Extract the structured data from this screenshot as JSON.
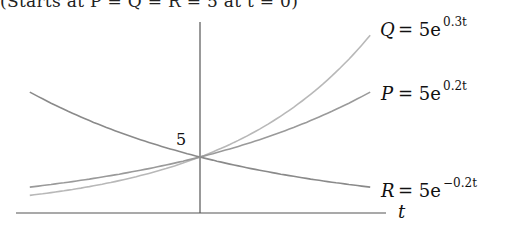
{
  "header": {
    "clipped_caption": "(Starts at P = Q = R = 5 at t = 0)"
  },
  "chart_data": {
    "type": "line",
    "title": "",
    "xlabel": "t",
    "ylabel": "",
    "annotations": [
      {
        "text": "5",
        "at": {
          "t": 0,
          "y": 5
        },
        "note": "common intercept of all curves"
      }
    ],
    "xlim": [
      -3.85,
      3.85
    ],
    "ylim": [
      0,
      18
    ],
    "grid": false,
    "legend": "inline labels at right end of each curve",
    "series": [
      {
        "name": "Q",
        "label": "Q = 5e^{0.3t}",
        "formula": "5*exp(0.3*t)",
        "color": "#b8b8b8",
        "x": [
          -3.85,
          -2,
          0,
          2,
          3.85
        ],
        "values": [
          1.58,
          2.74,
          5.0,
          9.11,
          15.9
        ]
      },
      {
        "name": "P",
        "label": "P = 5e^{0.2t}",
        "formula": "5*exp(0.2*t)",
        "color": "#9a9a9a",
        "x": [
          -3.85,
          -2,
          0,
          2,
          3.85
        ],
        "values": [
          2.32,
          3.35,
          5.0,
          7.46,
          10.8
        ]
      },
      {
        "name": "R",
        "label": "R = 5e^{-0.2t}",
        "formula": "5*exp(-0.2*t)",
        "color": "#8a8a8a",
        "x": [
          -3.85,
          -2,
          0,
          2,
          3.85
        ],
        "values": [
          10.8,
          7.46,
          5.0,
          3.35,
          2.32
        ]
      }
    ]
  },
  "labels": {
    "q_name": "Q",
    "q_rhs": "= 5e",
    "q_exp": "0.3t",
    "p_name": "P",
    "p_rhs": "= 5e",
    "p_exp": "0.2t",
    "r_name": "R",
    "r_rhs": "= 5e",
    "r_exp": "−0.2t",
    "intercept": "5",
    "x_axis": "t"
  },
  "colors": {
    "axis": "#555555",
    "curve_q": "#b8b8b8",
    "curve_p": "#9a9a9a",
    "curve_r": "#8a8a8a",
    "text": "#111111"
  }
}
